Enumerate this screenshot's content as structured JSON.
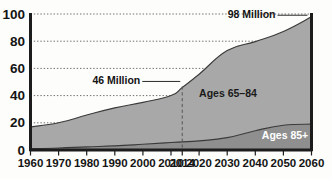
{
  "chart_data": {
    "type": "area",
    "stacked": true,
    "title": "",
    "subtitle": "",
    "xlabel": "",
    "ylabel": "",
    "grid": "horizontal-dotted",
    "legend_position": "inline-annotations",
    "xlim": [
      1960,
      2060
    ],
    "ylim": [
      0,
      100
    ],
    "x": [
      1960,
      1970,
      1980,
      1990,
      2000,
      2010,
      2014,
      2020,
      2030,
      2040,
      2050,
      2060
    ],
    "xtick_labels": [
      "1960",
      "1970",
      "1980",
      "1990",
      "2000",
      "2010",
      "2014",
      "2020",
      "2030",
      "2040",
      "2050",
      "2060"
    ],
    "ytick_values": [
      0,
      20,
      40,
      60,
      80,
      100
    ],
    "ytick_labels": [
      "0",
      "20",
      "40",
      "60",
      "80",
      "100"
    ],
    "series": [
      {
        "name": "Ages 85+",
        "color": "#8f8f8f",
        "label_color": "#ffffff",
        "values": [
          1,
          1.5,
          2.3,
          3.0,
          4.2,
          5.5,
          6.0,
          6.7,
          9.1,
          14.2,
          18.2,
          19.0
        ]
      },
      {
        "name": "Ages 65-84",
        "color": "#a8a8a8",
        "label_color": "#1a1a1a",
        "values": [
          16.0,
          18.5,
          23.4,
          28.0,
          30.8,
          34.5,
          40.0,
          49.0,
          64.0,
          65.5,
          69.0,
          79.0
        ]
      }
    ],
    "totals": [
      17.0,
      20.0,
      25.7,
      31.0,
      35.0,
      40.0,
      46.0,
      55.7,
      73.1,
      79.7,
      87.2,
      98.0
    ],
    "annotations": [
      {
        "text": "46 Million",
        "x": 2014,
        "y": 46,
        "align": "right-of-text-leader"
      },
      {
        "text": "98 Million",
        "x": 2060,
        "y": 98,
        "align": "left-of-point-leader"
      }
    ],
    "series_labels": [
      {
        "text": "Ages 65–84",
        "series": "Ages 65-84"
      },
      {
        "text": "Ages 85+",
        "series": "Ages 85+"
      }
    ],
    "marker_lines": [
      {
        "x": 2014,
        "style": "dashed",
        "color": "#555555"
      }
    ],
    "colors": {
      "background": "#fdfdfb",
      "axis": "#1c1c1c",
      "gridline": "#6e6e6e",
      "band_upper": "#a8a8a8",
      "band_lower": "#8f8f8f",
      "text": "#141414"
    }
  }
}
